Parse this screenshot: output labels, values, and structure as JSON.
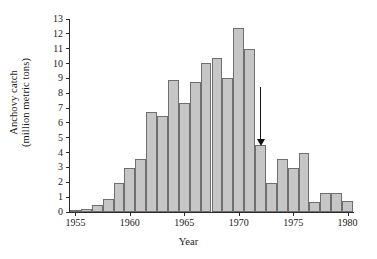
{
  "chart_data": {
    "type": "bar",
    "title": "",
    "xlabel": "Year",
    "ylabel": "Anchovy catch (million metric tons)",
    "ylabel_line1": "Anchovy catch",
    "ylabel_line2": "(million metric tons)",
    "grid": false,
    "legend": "none",
    "xlim": [
      1954.5,
      1980.5
    ],
    "ylim": [
      0,
      13
    ],
    "ytick_labels": [
      "0",
      "1",
      "2",
      "3",
      "4",
      "5",
      "6",
      "7",
      "8",
      "9",
      "10",
      "11",
      "12",
      "13"
    ],
    "ytick_values": [
      0,
      1,
      2,
      3,
      4,
      5,
      6,
      7,
      8,
      9,
      10,
      11,
      12,
      13
    ],
    "xtick_labels": [
      "1955",
      "1960",
      "1965",
      "1970",
      "1975",
      "1980"
    ],
    "xtick_values": [
      1955,
      1960,
      1965,
      1970,
      1975,
      1980
    ],
    "categories": [
      1955,
      1956,
      1957,
      1958,
      1959,
      1960,
      1961,
      1962,
      1963,
      1964,
      1965,
      1966,
      1967,
      1968,
      1969,
      1970,
      1971,
      1972,
      1973,
      1974,
      1975,
      1976,
      1977,
      1978,
      1979,
      1980
    ],
    "values": [
      0.1,
      0.2,
      0.45,
      0.9,
      1.95,
      2.95,
      3.6,
      6.75,
      6.5,
      8.9,
      7.35,
      8.75,
      10.05,
      10.35,
      9.05,
      12.4,
      10.95,
      4.5,
      1.95,
      3.6,
      2.95,
      4.0,
      0.7,
      1.25,
      1.3,
      0.75
    ],
    "bar_fill": "#c6c6c6",
    "bar_edge": "#6f6f6f",
    "axis_color": "#2b2b2b",
    "annotations": [
      {
        "name": "collapse-arrow",
        "type": "arrow",
        "direction": "down",
        "x_value": 1972,
        "y_top": 8.4,
        "y_tip": 4.9,
        "color": "#111111"
      }
    ]
  }
}
